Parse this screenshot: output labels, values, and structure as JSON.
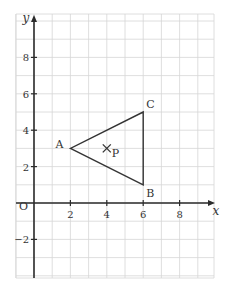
{
  "diagram": {
    "type": "coordinate-grid",
    "axes": {
      "x_label": "x",
      "y_label": "y",
      "origin_label": "O",
      "x_range": [
        -1,
        10
      ],
      "y_range": [
        -4,
        10
      ],
      "x_ticks": [
        2,
        4,
        6,
        8
      ],
      "y_ticks": [
        -2,
        2,
        4,
        6,
        8
      ],
      "x_tick_labels": [
        "2",
        "4",
        "6",
        "8"
      ],
      "y_tick_labels": [
        "-2",
        "2",
        "4",
        "6",
        "8"
      ]
    },
    "triangle": {
      "vertices": [
        {
          "label": "A",
          "x": 2,
          "y": 3
        },
        {
          "label": "B",
          "x": 6,
          "y": 1
        },
        {
          "label": "C",
          "x": 6,
          "y": 5
        }
      ]
    },
    "point": {
      "label": "P",
      "x": 4,
      "y": 3,
      "marker": "cross"
    },
    "colors": {
      "grid": "#d6d6d6",
      "ink": "#2b2b2b"
    }
  }
}
